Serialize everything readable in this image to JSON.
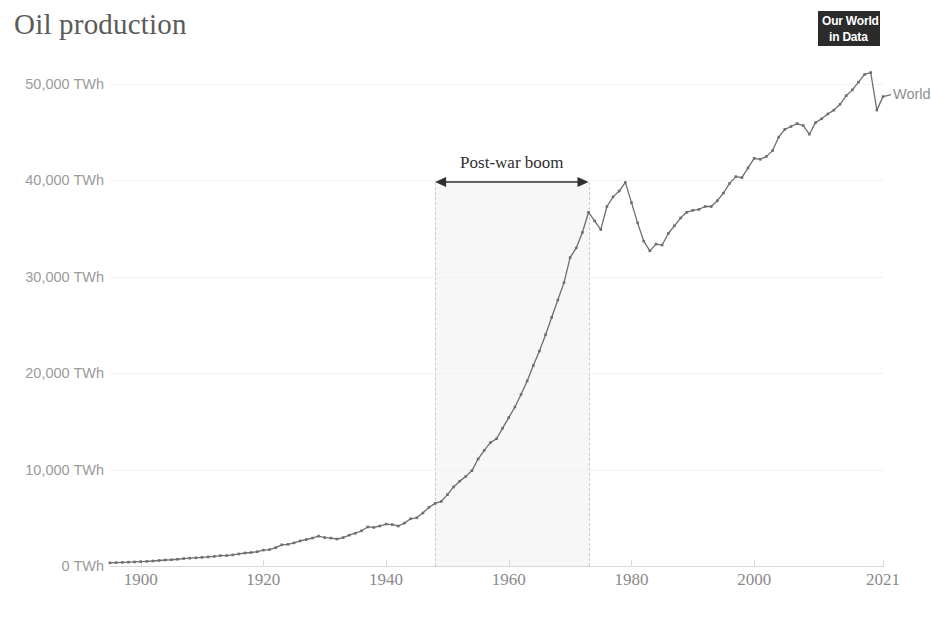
{
  "header": {
    "title": "Oil production",
    "logo_line1": "Our World",
    "logo_line2": "in Data"
  },
  "colors": {
    "line": "#6e6e6e",
    "text": "#5b5b5b",
    "tick": "#9b9b9b",
    "band": "#f7f7f7",
    "band_edge": "#c9c9c9",
    "annotation": "#2f2f2f",
    "logo_bg": "#2b2b2b"
  },
  "chart_data": {
    "type": "line",
    "title": "Oil production",
    "xlabel": "",
    "ylabel": "",
    "unit": "TWh",
    "grid": true,
    "legend_position": "inline-right",
    "xlim": [
      1895,
      2021
    ],
    "ylim": [
      0,
      52500
    ],
    "ytick_values": [
      0,
      10000,
      20000,
      30000,
      40000,
      50000
    ],
    "ytick_labels": [
      "0 TWh",
      "10,000 TWh",
      "20,000 TWh",
      "30,000 TWh",
      "40,000 TWh",
      "50,000 TWh"
    ],
    "xtick_values": [
      1900,
      1920,
      1940,
      1960,
      1980,
      2000,
      2021
    ],
    "xtick_labels": [
      "1900",
      "1920",
      "1940",
      "1960",
      "1980",
      "2000",
      "2021"
    ],
    "series": [
      {
        "name": "World",
        "color": "#6e6e6e",
        "markers": true,
        "x": [
          1895,
          1896,
          1897,
          1898,
          1899,
          1900,
          1901,
          1902,
          1903,
          1904,
          1905,
          1906,
          1907,
          1908,
          1909,
          1910,
          1911,
          1912,
          1913,
          1914,
          1915,
          1916,
          1917,
          1918,
          1919,
          1920,
          1921,
          1922,
          1923,
          1924,
          1925,
          1926,
          1927,
          1928,
          1929,
          1930,
          1931,
          1932,
          1933,
          1934,
          1935,
          1936,
          1937,
          1938,
          1939,
          1940,
          1941,
          1942,
          1943,
          1944,
          1945,
          1946,
          1947,
          1948,
          1949,
          1950,
          1951,
          1952,
          1953,
          1954,
          1955,
          1956,
          1957,
          1958,
          1959,
          1960,
          1961,
          1962,
          1963,
          1964,
          1965,
          1966,
          1967,
          1968,
          1969,
          1970,
          1971,
          1972,
          1973,
          1974,
          1975,
          1976,
          1977,
          1978,
          1979,
          1980,
          1981,
          1982,
          1983,
          1984,
          1985,
          1986,
          1987,
          1988,
          1989,
          1990,
          1991,
          1992,
          1993,
          1994,
          1995,
          1996,
          1997,
          1998,
          1999,
          2000,
          2001,
          2002,
          2003,
          2004,
          2005,
          2006,
          2007,
          2008,
          2009,
          2010,
          2011,
          2012,
          2013,
          2014,
          2015,
          2016,
          2017,
          2018,
          2019,
          2020,
          2021
        ],
        "y": [
          330,
          350,
          370,
          400,
          420,
          450,
          480,
          520,
          570,
          620,
          650,
          700,
          770,
          810,
          850,
          900,
          940,
          1000,
          1080,
          1080,
          1150,
          1250,
          1350,
          1400,
          1480,
          1650,
          1700,
          1900,
          2200,
          2250,
          2400,
          2600,
          2750,
          2900,
          3100,
          2950,
          2900,
          2800,
          2950,
          3200,
          3400,
          3650,
          4050,
          4000,
          4150,
          4350,
          4300,
          4150,
          4450,
          4900,
          5000,
          5500,
          6100,
          6500,
          6700,
          7400,
          8200,
          8800,
          9300,
          9900,
          11100,
          12000,
          12800,
          13200,
          14300,
          15400,
          16500,
          17800,
          19200,
          20800,
          22300,
          24000,
          25800,
          27600,
          29400,
          32000,
          33000,
          34600,
          36700,
          35800,
          34900,
          37300,
          38300,
          38900,
          39800,
          37700,
          35600,
          33700,
          32700,
          33400,
          33300,
          34500,
          35300,
          36100,
          36700,
          36900,
          37000,
          37300,
          37300,
          37900,
          38700,
          39700,
          40400,
          40300,
          41300,
          42300,
          42200,
          42500,
          43100,
          44500,
          45300,
          45600,
          45900,
          45700,
          44800,
          46000,
          46400,
          46900,
          47300,
          47900,
          48800,
          49400,
          50200,
          51000,
          51200,
          47300,
          48700
        ]
      }
    ],
    "series_label": "World",
    "annotations": [
      {
        "type": "span",
        "label": "Post-war boom",
        "x_start": 1948,
        "x_end": 1973,
        "shaded": true,
        "arrow": "double"
      }
    ]
  }
}
